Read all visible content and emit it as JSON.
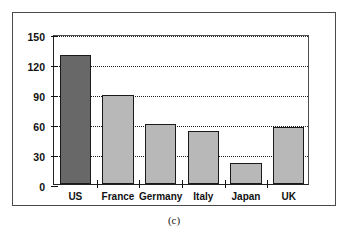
{
  "figure": {
    "caption": "(c)",
    "frame_color": "#4a4a4a",
    "background": "#ffffff"
  },
  "chart_data": {
    "type": "bar",
    "title": "",
    "xlabel": "",
    "ylabel": "",
    "categories": [
      "US",
      "France",
      "Germany",
      "Italy",
      "Japan",
      "UK"
    ],
    "values": [
      129,
      89,
      60,
      53,
      21,
      57
    ],
    "ylim": [
      0,
      150
    ],
    "yticks": [
      0,
      30,
      60,
      90,
      120,
      150
    ],
    "ytick_labels": [
      "0",
      "30",
      "60",
      "90",
      "120",
      "150"
    ],
    "grid": true,
    "grid_style": "dotted",
    "legend": "none",
    "bar_colors": [
      "#686868",
      "#b8b8b8",
      "#b8b8b8",
      "#b8b8b8",
      "#b8b8b8",
      "#b8b8b8"
    ],
    "bar_edge_color": "#1a1a1a",
    "highlight_category": "US"
  }
}
